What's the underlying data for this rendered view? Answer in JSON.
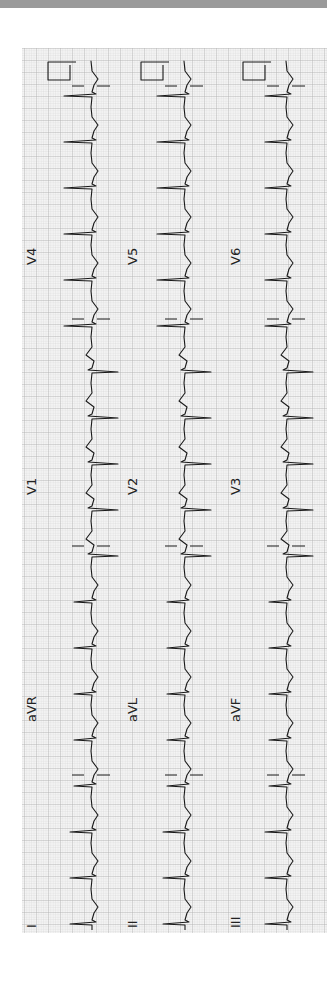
{
  "figure": {
    "type": "12-lead electrocardiogram (rotated 90°)",
    "colors": {
      "top_band": "#9a9a9a",
      "paper": "#f4f4f4",
      "grid_minor": "#cfcfcf",
      "grid_major": "#a8a8a8",
      "trace": "#1a1a1a",
      "label": "#222222"
    },
    "columns": [
      {
        "id": "col1",
        "baseline_x": 92,
        "label_x": 36
      },
      {
        "id": "col2",
        "baseline_x": 185,
        "label_x": 137
      },
      {
        "id": "col3",
        "baseline_x": 287,
        "label_x": 240
      }
    ],
    "leads": [
      {
        "name": "V4",
        "column": 0,
        "label_y": 265
      },
      {
        "name": "V5",
        "column": 1,
        "label_y": 265
      },
      {
        "name": "V6",
        "column": 2,
        "label_y": 265
      },
      {
        "name": "V1",
        "column": 0,
        "label_y": 495
      },
      {
        "name": "V2",
        "column": 1,
        "label_y": 495
      },
      {
        "name": "V3",
        "column": 2,
        "label_y": 495
      },
      {
        "name": "aVR",
        "column": 0,
        "label_y": 722
      },
      {
        "name": "aVL",
        "column": 1,
        "label_y": 722
      },
      {
        "name": "aVF",
        "column": 2,
        "label_y": 722
      },
      {
        "name": "I",
        "column": 0,
        "label_y": 928
      },
      {
        "name": "II",
        "column": 1,
        "label_y": 928
      },
      {
        "name": "III",
        "column": 2,
        "label_y": 928
      }
    ]
  }
}
